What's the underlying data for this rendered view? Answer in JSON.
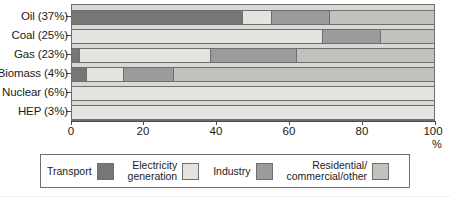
{
  "chart_data": {
    "type": "bar",
    "orientation": "horizontal",
    "stacked": true,
    "title": "",
    "xlabel": "%",
    "ylabel": "",
    "xlim": [
      0,
      100
    ],
    "xticks": [
      0,
      20,
      40,
      60,
      80,
      100
    ],
    "xtick_labels": [
      "0",
      "20",
      "40",
      "60",
      "80",
      "100"
    ],
    "grid": false,
    "legend_position": "bottom",
    "categories": [
      "Oil (37%)",
      "Coal (25%)",
      "Gas (23%)",
      "Biomass (4%)",
      "Nuclear (6%)",
      "HEP (3%)"
    ],
    "series": [
      {
        "name": "Transport",
        "color": "#767676",
        "values": [
          47,
          0,
          2,
          4,
          0,
          0
        ]
      },
      {
        "name": "Electricity generation",
        "color": "#e3e3e0",
        "values": [
          8,
          69,
          36,
          10,
          100,
          100
        ]
      },
      {
        "name": "Industry",
        "color": "#9b9b9b",
        "values": [
          16,
          16,
          24,
          14,
          0,
          0
        ]
      },
      {
        "name": "Residential/commercial/other",
        "color": "#c2c2bd",
        "values": [
          29,
          15,
          38,
          72,
          0,
          0
        ]
      }
    ]
  },
  "axis": {
    "x_unit_label": "%",
    "tick_labels": [
      "0",
      "20",
      "40",
      "60",
      "80",
      "100"
    ]
  },
  "legend": {
    "items": [
      {
        "label": "Transport",
        "color": "#767676"
      },
      {
        "label": "Electricity\ngeneration",
        "color": "#e3e3e0"
      },
      {
        "label": "Industry",
        "color": "#9b9b9b"
      },
      {
        "label": "Residential/\ncommercial/other",
        "color": "#c2c2bd"
      }
    ]
  },
  "colors": {
    "transport": "#767676",
    "electricity_generation": "#e3e3e0",
    "industry": "#9b9b9b",
    "residential_commercial_other": "#c2c2bd",
    "plot_background": "#d8d8d4",
    "axis": "#4a4a4a",
    "text": "#1b1b1b"
  }
}
